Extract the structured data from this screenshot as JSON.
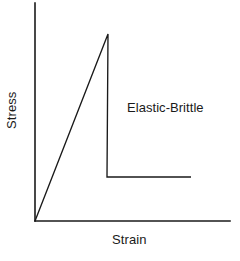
{
  "figure": {
    "width": 240,
    "height": 261,
    "background_color": "#ffffff",
    "line_color": "#1a1a1a",
    "text_color": "#1a1a1a"
  },
  "labels": {
    "ylabel": "Stress",
    "xlabel": "Strain",
    "annotation": "Elastic-Brittle"
  },
  "chart_data": {
    "type": "line",
    "title": "",
    "subtitle": "",
    "xlabel": "Strain",
    "ylabel": "Stress",
    "xlim": [
      0,
      1
    ],
    "ylim": [
      0,
      1
    ],
    "grid": false,
    "legend": null,
    "axes_ticks": {
      "x": [],
      "y": []
    },
    "annotations": [
      {
        "text": "Elastic-Brittle",
        "x": 0.47,
        "y": 0.55
      }
    ],
    "series": [
      {
        "name": "Elastic-Brittle",
        "description": "Linear elastic rise to fracture, then sudden load drop to a low residual plateau",
        "x": [
          0.0,
          0.375,
          0.37,
          0.8
        ],
        "y": [
          0.0,
          1.0,
          0.235,
          0.235
        ],
        "points_px": [
          {
            "x": 35,
            "y": 221
          },
          {
            "x": 108,
            "y": 34
          },
          {
            "x": 107,
            "y": 177
          },
          {
            "x": 191,
            "y": 177
          }
        ]
      }
    ],
    "axis_lines": {
      "y_axis_px": {
        "x": 35,
        "y_top": 3,
        "y_bottom": 221
      },
      "x_axis_px": {
        "y": 221,
        "x_left": 35,
        "x_right": 230
      }
    }
  }
}
